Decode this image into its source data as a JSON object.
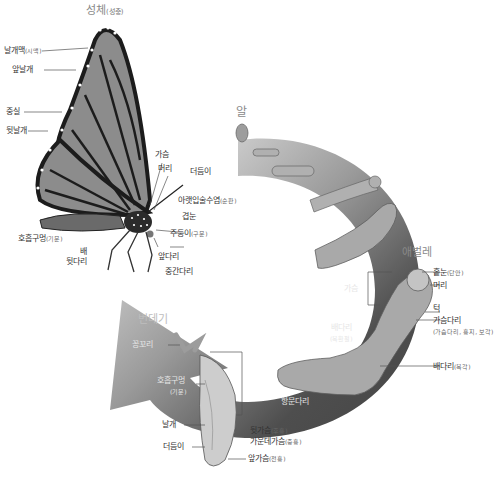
{
  "colors": {
    "arc_dark": "#4a4a4a",
    "arc_light": "#e8e8e8",
    "wing_fill": "#8c8c8c",
    "wing_vein": "#1c1c1c",
    "larva_fill": "#a9a9a9",
    "pupa_fill": "#c8c8c8",
    "label_text": "#333333"
  },
  "stages": {
    "adult": {
      "label": "성체",
      "sub": "(성충)"
    },
    "egg": {
      "label": "알"
    },
    "larva": {
      "label": "애벌레"
    },
    "pupa": {
      "label": "번데기"
    }
  },
  "adult_labels": [
    {
      "text": "날개맥",
      "sub": "(시맥)"
    },
    {
      "text": "앞날개"
    },
    {
      "text": "중실"
    },
    {
      "text": "뒷날개"
    },
    {
      "text": "가슴"
    },
    {
      "text": "머리"
    },
    {
      "text": "더듬이"
    },
    {
      "text": "아랫입술수염",
      "sub": "(순판)"
    },
    {
      "text": "겹눈"
    },
    {
      "text": "주둥이",
      "sub": "(구문)"
    },
    {
      "text": "호흡구멍",
      "sub": "(기문)"
    },
    {
      "text": "배"
    },
    {
      "text": "뒷다리"
    },
    {
      "text": "앞다리"
    },
    {
      "text": "중간다리"
    }
  ],
  "larva_labels": [
    {
      "text": "홑눈",
      "sub": "(단안)"
    },
    {
      "text": "머리"
    },
    {
      "text": "가슴"
    },
    {
      "text": "턱"
    },
    {
      "text": "가슴다리"
    },
    {
      "text": "(가슴다리, 흉지, 보각)"
    },
    {
      "text": "배다리"
    },
    {
      "text": "(복환절)"
    },
    {
      "text": "배다리",
      "sub": "(복각)"
    },
    {
      "text": "항문다리"
    }
  ],
  "pupa_labels": [
    {
      "text": "꽁꼬리"
    },
    {
      "text": "호흡구멍"
    },
    {
      "text": "(기문)"
    },
    {
      "text": "날개"
    },
    {
      "text": "더듬이"
    },
    {
      "text": "뒷가슴",
      "sub": "(후흉)"
    },
    {
      "text": "가운데가슴",
      "sub": "(중흉)"
    },
    {
      "text": "앞가슴",
      "sub": "(전흉)"
    }
  ]
}
